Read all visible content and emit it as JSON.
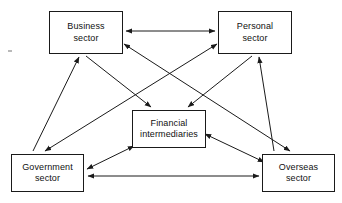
{
  "diagram": {
    "type": "node-link-diagram",
    "canvas": {
      "width": 342,
      "height": 203,
      "background": "#ffffff"
    },
    "style": {
      "line_color": "#1a1a1a",
      "box_border": "#1a1a1a",
      "box_fill": "#ffffff",
      "text_color": "#111111"
    },
    "nodes": [
      {
        "id": "business",
        "label": "Business sector",
        "lines": [
          "Business",
          "sector"
        ],
        "x": 49,
        "y": 11,
        "w": 74,
        "h": 43
      },
      {
        "id": "personal",
        "label": "Personal sector",
        "lines": [
          "Personal",
          "sector"
        ],
        "x": 218,
        "y": 11,
        "w": 74,
        "h": 43
      },
      {
        "id": "financial",
        "label": "Financial intermediaries",
        "lines": [
          "Financial",
          "intermediaries"
        ],
        "x": 132,
        "y": 110,
        "w": 74,
        "h": 38
      },
      {
        "id": "government",
        "label": "Government sector",
        "lines": [
          "Government",
          "sector"
        ],
        "x": 11,
        "y": 154,
        "w": 73,
        "h": 38
      },
      {
        "id": "overseas",
        "label": "Overseas sector",
        "lines": [
          "Overseas",
          "sector"
        ],
        "x": 262,
        "y": 154,
        "w": 73,
        "h": 38
      }
    ],
    "edges": [
      {
        "id": "business-personal",
        "from": "business",
        "to": "personal",
        "arrows": "both",
        "x1": 126,
        "y1": 31,
        "x2": 215,
        "y2": 31
      },
      {
        "id": "government-overseas",
        "from": "government",
        "to": "overseas",
        "arrows": "both",
        "x1": 88,
        "y1": 176,
        "x2": 259,
        "y2": 176
      },
      {
        "id": "business-overseas",
        "from": "business",
        "to": "overseas",
        "arrows": "both",
        "x1": 124,
        "y1": 45,
        "x2": 289,
        "y2": 151
      },
      {
        "id": "personal-government",
        "from": "personal",
        "to": "government",
        "arrows": "both",
        "x1": 216,
        "y1": 45,
        "x2": 44,
        "y2": 151
      },
      {
        "id": "government-financial",
        "from": "government",
        "to": "financial",
        "arrows": "both",
        "x1": 87,
        "y1": 168,
        "x2": 135,
        "y2": 145
      },
      {
        "id": "overseas-financial",
        "from": "overseas",
        "to": "financial",
        "arrows": "both",
        "x1": 265,
        "y1": 163,
        "x2": 204,
        "y2": 135
      },
      {
        "id": "business-to-financial",
        "from": "business",
        "to": "financial",
        "arrows": "to",
        "x1": 89,
        "y1": 57,
        "x2": 152,
        "y2": 107
      },
      {
        "id": "personal-to-financial",
        "from": "personal",
        "to": "financial",
        "arrows": "to",
        "x1": 252,
        "y1": 57,
        "x2": 187,
        "y2": 107
      },
      {
        "id": "personal-to-overseas-up",
        "from": "overseas",
        "to": "personal",
        "arrows": "to",
        "x1": 274,
        "y1": 151,
        "x2": 258,
        "y2": 57
      },
      {
        "id": "government-to-business-up",
        "from": "government",
        "to": "business",
        "arrows": "to",
        "x1": 33,
        "y1": 151,
        "x2": 81,
        "y2": 57
      }
    ]
  }
}
